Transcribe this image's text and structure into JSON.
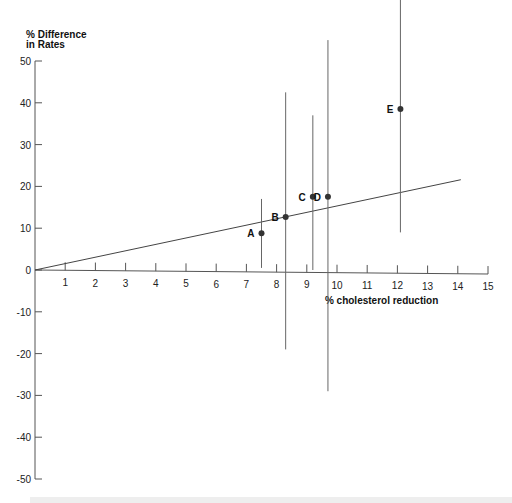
{
  "chart_data": {
    "type": "scatter",
    "title": "",
    "xlabel": "% cholesterol reduction",
    "ylabel": "% Difference in Rates",
    "xlim": [
      0,
      15
    ],
    "ylim": [
      -50,
      50
    ],
    "x_ticks": [
      1,
      2,
      3,
      4,
      5,
      6,
      7,
      8,
      9,
      10,
      11,
      12,
      13,
      14,
      15
    ],
    "y_ticks": [
      50,
      40,
      30,
      20,
      10,
      0,
      -10,
      -20,
      -30,
      -40,
      -50
    ],
    "y_tick_labels": [
      "50",
      "40",
      "30",
      "20",
      "10",
      "0",
      "-10",
      "-20",
      "-30",
      "-40",
      "-50"
    ],
    "grid": false,
    "points": [
      {
        "label": "A",
        "x": 7.5,
        "y": 8.8,
        "ci_low": 0.5,
        "ci_high": 17
      },
      {
        "label": "B",
        "x": 8.3,
        "y": 12.7,
        "ci_low": -19,
        "ci_high": 42.5
      },
      {
        "label": "C",
        "x": 9.2,
        "y": 17.5,
        "ci_low": 0,
        "ci_high": 37
      },
      {
        "label": "D",
        "x": 9.7,
        "y": 17.5,
        "ci_low": -29,
        "ci_high": 55
      },
      {
        "label": "E",
        "x": 12.1,
        "y": 38.5,
        "ci_low": 9,
        "ci_high": 65
      }
    ],
    "regression_line": {
      "x0": 0,
      "y0": 0,
      "x1": 14.1,
      "y1": 21.6
    }
  },
  "labels": {
    "ylabel_line1": "% Difference",
    "ylabel_line2": "in Rates",
    "xlabel": "% cholesterol reduction"
  }
}
